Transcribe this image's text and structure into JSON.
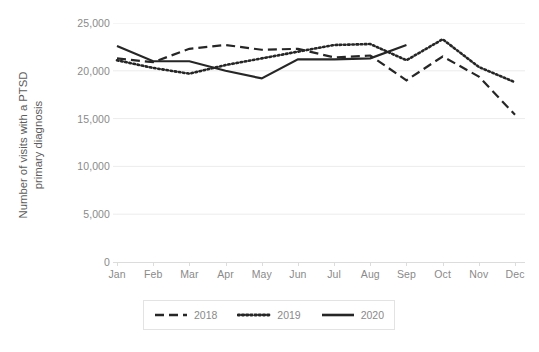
{
  "chart_data": {
    "type": "line",
    "title": "",
    "xlabel": "",
    "ylabel": "Number of visits with a PTSD primary diagnosis",
    "ylabel_line1": "Number of visits with a PTSD",
    "ylabel_line2": "primary diagnosis",
    "categories": [
      "Jan",
      "Feb",
      "Mar",
      "Apr",
      "May",
      "Jun",
      "Jul",
      "Aug",
      "Sep",
      "Oct",
      "Nov",
      "Dec"
    ],
    "ylim": [
      0,
      25000
    ],
    "ytick_labels": [
      "0",
      "5,000",
      "10,000",
      "15,000",
      "20,000",
      "25,000"
    ],
    "ytick_values": [
      0,
      5000,
      10000,
      15000,
      20000,
      25000
    ],
    "grid": true,
    "grid_axis": "y",
    "legend_position": "bottom",
    "series": [
      {
        "name": "2018",
        "style": "dashed",
        "color": "#262626",
        "values": [
          21300,
          20900,
          22300,
          22700,
          22200,
          22300,
          21400,
          21600,
          19000,
          21500,
          19400,
          15400
        ]
      },
      {
        "name": "2019",
        "style": "dotted",
        "color": "#262626",
        "values": [
          21100,
          20300,
          19700,
          20600,
          21300,
          22000,
          22700,
          22800,
          21100,
          23300,
          20400,
          18800
        ]
      },
      {
        "name": "2020",
        "style": "solid",
        "color": "#262626",
        "values": [
          22600,
          21000,
          21000,
          20000,
          19200,
          21200,
          21200,
          21300,
          22700,
          null,
          null,
          null
        ]
      }
    ]
  },
  "legend": {
    "items": [
      {
        "label": "2018",
        "style": "dashed"
      },
      {
        "label": "2019",
        "style": "dotted"
      },
      {
        "label": "2020",
        "style": "solid"
      }
    ]
  },
  "colors": {
    "line": "#262626",
    "tick_text": "#8a8a8a",
    "axis_title": "#5c5c5c",
    "grid": "#ececec",
    "legend_border": "#e3e3e3",
    "background": "#ffffff"
  }
}
